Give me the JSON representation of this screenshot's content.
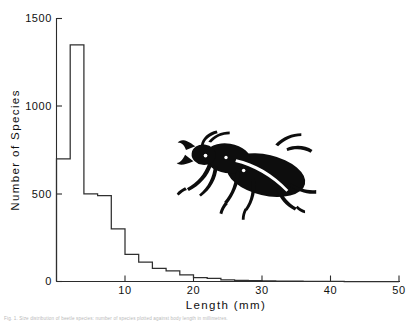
{
  "figure": {
    "title": "",
    "caption_line": "Fig. 1. Size distribution of beetle species: number of species plotted against body length in millimetres."
  },
  "chart_data": {
    "type": "bar",
    "title": "",
    "subtitle": "",
    "xlabel": "Length  (mm)",
    "ylabel": "Number  of  Species",
    "xlim": [
      0,
      50
    ],
    "ylim": [
      0,
      1500
    ],
    "grid": false,
    "legend": "none",
    "bin_width": 2,
    "x_ticks": [
      10,
      20,
      30,
      40,
      50
    ],
    "x_tick_labels": [
      "10",
      "20",
      "30",
      "40",
      "50"
    ],
    "y_ticks": [
      0,
      500,
      1000,
      1500
    ],
    "y_tick_labels": [
      "0",
      "500",
      "1000",
      "1500"
    ],
    "bin_starts": [
      0,
      2,
      4,
      6,
      8,
      10,
      12,
      14,
      16,
      18,
      20,
      22,
      24,
      26,
      28,
      30,
      32,
      34,
      36,
      38,
      40,
      42,
      44,
      46,
      48
    ],
    "values": [
      700,
      1350,
      500,
      490,
      300,
      155,
      110,
      75,
      60,
      38,
      22,
      18,
      10,
      7,
      5,
      3,
      2,
      2,
      1,
      1,
      1,
      0,
      0,
      0,
      0
    ],
    "peak_bin": "2-4 mm",
    "peak_value": 1350,
    "annotations": [
      {
        "name": "beetle-silhouette",
        "label": "stag beetle illustration",
        "x_mm": 25,
        "y_species": 800
      }
    ]
  },
  "axes": {
    "y_axis_name": "number-of-species-axis",
    "x_axis_name": "length-axis"
  }
}
